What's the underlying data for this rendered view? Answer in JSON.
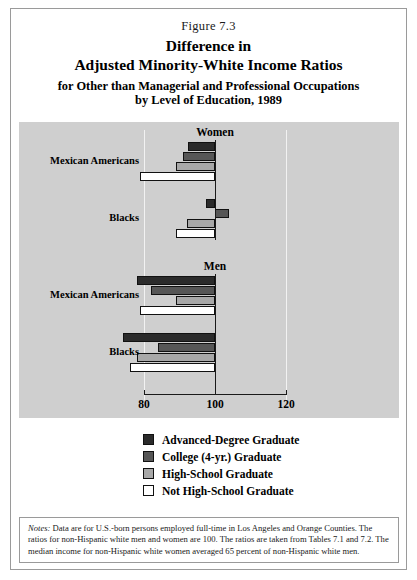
{
  "figure": {
    "number": "Figure 7.3",
    "title_line_1": "Difference in",
    "title_line_2": "Adjusted Minority-White Income Ratios",
    "subtitle_line_1": "for Other than Managerial and Professional Occupations",
    "subtitle_line_2": "by Level of Education, 1989"
  },
  "notes": {
    "label": "Notes:",
    "text": "  Data are for U.S.-born persons employed full-time in Los Angeles and Orange Counties. The ratios for non-Hispanic white men and women are 100. The ratios are taken from Tables 7.1 and 7.2. The median income for non-Hispanic white women averaged 65 percent of non-Hispanic white men."
  },
  "legend": {
    "items": [
      {
        "label": "Advanced-Degree Graduate",
        "color": "#2b2b2b"
      },
      {
        "label": "College (4-yr.) Graduate",
        "color": "#565656"
      },
      {
        "label": "High-School Graduate",
        "color": "#a8a8a8"
      },
      {
        "label": "Not High-School Graduate",
        "color": "#ffffff"
      }
    ]
  },
  "chart_data": {
    "type": "bar",
    "orientation": "horizontal",
    "title": "Difference in Adjusted Minority-White Income Ratios",
    "xlabel": "",
    "ylabel": "",
    "xlim": [
      72,
      124
    ],
    "baseline": 100,
    "xticks": [
      80,
      100,
      120
    ],
    "xtick_labels": [
      "80",
      "100",
      "120"
    ],
    "gridlines": [
      80,
      120
    ],
    "grid": true,
    "legend_position": "bottom",
    "series": [
      {
        "name": "Advanced-Degree Graduate",
        "color": "#2b2b2b"
      },
      {
        "name": "College (4-yr.) Graduate",
        "color": "#565656"
      },
      {
        "name": "High-School Graduate",
        "color": "#a8a8a8"
      },
      {
        "name": "Not High-School Graduate",
        "color": "#ffffff"
      }
    ],
    "groups": [
      {
        "name": "Women",
        "categories": [
          {
            "label": "Mexican Americans",
            "values": [
              92.5,
              91,
              89,
              79
            ]
          },
          {
            "label": "Blacks",
            "values": [
              97.5,
              104,
              92,
              89
            ]
          }
        ]
      },
      {
        "name": "Men",
        "categories": [
          {
            "label": "Mexican Americans",
            "values": [
              78,
              82,
              89,
              79
            ]
          },
          {
            "label": "Blacks",
            "values": [
              74,
              84,
              78,
              76
            ]
          }
        ]
      }
    ]
  }
}
